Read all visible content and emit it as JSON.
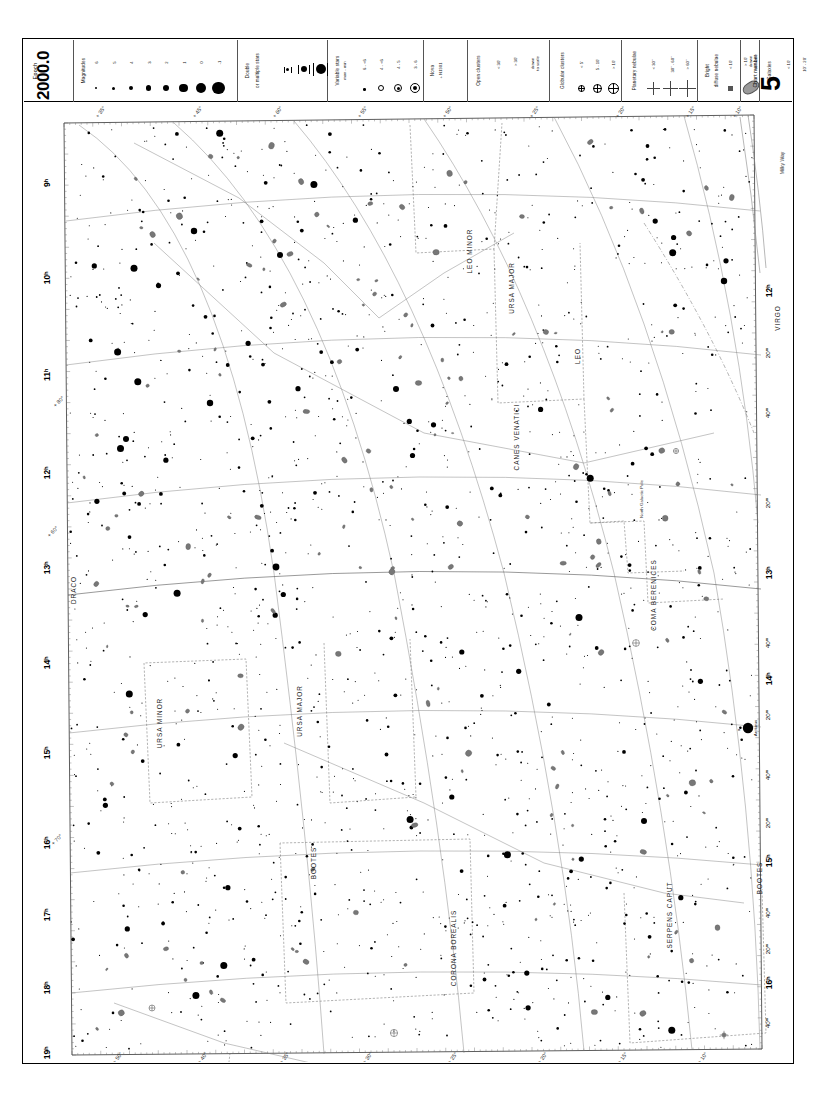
{
  "chart": {
    "number": "5",
    "number_label": "Chart number",
    "epoch_label": "Epoch",
    "epoch_value": "2000.0",
    "milky_way_label": "Milky Way"
  },
  "legend": {
    "magnitudes": {
      "title": "Magnitudes",
      "values": [
        "6",
        "5",
        "4",
        "3",
        "2",
        "1",
        "0",
        "-1"
      ]
    },
    "double": {
      "title": "Double\nor multiple stars",
      "line1": "Double",
      "line2": "or multiple stars"
    },
    "variable": {
      "line1": "Variable stars",
      "line2": "max - min",
      "entries": [
        "6 - <6",
        "4 - <6",
        "4 - 5",
        "3 - 6"
      ]
    },
    "nova": {
      "line1": "Nova",
      "line2": "+ N1901"
    },
    "open_clusters": {
      "title": "Open clusters",
      "entries": [
        "< 30'",
        "> 30'",
        "drawn\nto scale"
      ],
      "e1": "< 30'",
      "e2": "> 30'",
      "e3a": "drawn",
      "e3b": "to scale"
    },
    "globular_clusters": {
      "title": "Globular clusters",
      "e1": "< 5'",
      "e2": "5 - 10'",
      "e3": "> 10'"
    },
    "planetary_nebulae": {
      "title": "Planetary nebulae",
      "e1": "< 30\"",
      "e2": "30\" - 60\"",
      "e3": "> 60\""
    },
    "diffuse_nebulae": {
      "line1": "Bright",
      "line2": "diffuse nebulae",
      "e1": "< 10'",
      "e2a": "> 10'",
      "e2b": "drawn",
      "e2c": "to scale"
    },
    "galaxies": {
      "title": "Galaxies",
      "e1": "< 10'",
      "e2": "10' - 20'",
      "e3": "20' - 30'",
      "e4a": "> 30'",
      "e4b": "drawn",
      "e4c": "to scale"
    }
  },
  "chart_data": {
    "type": "scatter",
    "xlabel": "Right Ascension",
    "ylabel": "Declination",
    "ra_range_hours": [
      9,
      20
    ],
    "dec_range_degrees": [
      10,
      75
    ],
    "ra_labels_left": [
      "9ʰ",
      "10ʰ",
      "11ʰ",
      "12ʰ",
      "13ʰ",
      "14ʰ",
      "15ʰ",
      "16ʰ",
      "17ʰ",
      "18ʰ",
      "19ʰ"
    ],
    "ra_labels_right": [
      "12ʰ",
      "13ʰ",
      "14ʰ",
      "15ʰ",
      "16ʰ"
    ],
    "minute_labels_right": [
      "20ᵐ",
      "40ᵐ",
      "20ᵐ",
      "40ᵐ",
      "20ᵐ",
      "40ᵐ",
      "20ᵐ",
      "40ᵐ",
      "20ᵐ",
      "40ᵐ"
    ],
    "dec_labels_top": [
      "+ 35°",
      "+ 45°",
      "+ 60°",
      "+ 55°",
      "+ 50°",
      "+ 25°",
      "+ 20°",
      "+ 15°",
      "+ 10°"
    ],
    "dec_labels_left": [
      "+ 60°",
      "+ 70°",
      "+ 80°"
    ],
    "dec_labels_bottom": [
      "+ 50°",
      "+ 40°",
      "+ 35°",
      "+ 30°",
      "+ 25°",
      "+ 20°",
      "+ 15°",
      "+ 10°"
    ],
    "constellations": [
      {
        "name": "LEO MINOR",
        "x": 448,
        "y": 148
      },
      {
        "name": "URSA MAJOR",
        "x": 490,
        "y": 185
      },
      {
        "name": "LEO",
        "x": 556,
        "y": 253
      },
      {
        "name": "CANES VENATICI",
        "x": 495,
        "y": 334
      },
      {
        "name": "VIRGO",
        "x": 756,
        "y": 215
      },
      {
        "name": "DRACO",
        "x": 52,
        "y": 487
      },
      {
        "name": "URSA MINOR",
        "x": 138,
        "y": 620
      },
      {
        "name": "URSA MAJOR",
        "x": 278,
        "y": 608
      },
      {
        "name": "COMA BERENICES",
        "x": 632,
        "y": 492
      },
      {
        "name": "BOOTES",
        "x": 292,
        "y": 760
      },
      {
        "name": "BOOTES",
        "x": 738,
        "y": 775
      },
      {
        "name": "CORONA BOREALIS",
        "x": 432,
        "y": 845
      },
      {
        "name": "SERPENS CAPUT",
        "x": 648,
        "y": 812
      },
      {
        "name": "HERCULES",
        "x": 183,
        "y": 1008
      },
      {
        "name": "HERCULES",
        "x": 748,
        "y": 1010
      },
      {
        "name": "LYRA",
        "x": 110,
        "y": 1022
      },
      {
        "name": "DRACO",
        "x": 60,
        "y": 1015
      }
    ],
    "named_stars": [
      {
        "name": "Arcturus",
        "bayer": "α",
        "x": 724,
        "y": 625,
        "mag": -0.05
      },
      {
        "name": "North Galactic Pole",
        "x": 610,
        "y": 396
      }
    ],
    "notable_objects": [
      "M3",
      "M51",
      "M101",
      "M63",
      "M94",
      "M106",
      "M13",
      "M92",
      "M64",
      "M81",
      "M82"
    ]
  }
}
